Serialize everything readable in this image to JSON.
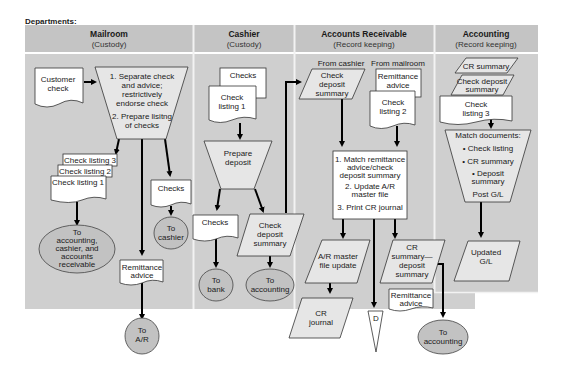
{
  "title": "Departments:",
  "lanes": [
    {
      "name": "Mailroom",
      "role": "(Custody)"
    },
    {
      "name": "Cashier",
      "role": "(Custody)"
    },
    {
      "name": "Accounts Receivable",
      "role": "(Record keeping)"
    },
    {
      "name": "Accounting",
      "role": "(Record keeping)"
    }
  ],
  "mailroom": {
    "customer_check": [
      "Customer",
      "check"
    ],
    "process": [
      "1. Separate check",
      "and advice;",
      "restrictively",
      "endorse check",
      "",
      "2. Prepare lisitng",
      "of checks"
    ],
    "check_listing_3": "Check listing 3",
    "check_listing_2": "Check listing 2",
    "check_listing_1": "Check listing 1",
    "to_all": [
      "To",
      "accounting,",
      "cashier, and",
      "accounts",
      "receivable"
    ],
    "checks": "Checks",
    "to_cashier": [
      "To",
      "cashier"
    ],
    "remittance_advice": [
      "Remittance",
      "advice"
    ],
    "to_ar": [
      "To",
      "A/R"
    ]
  },
  "cashier": {
    "checks_top": "Checks",
    "check_listing_1": [
      "Check",
      "listing 1"
    ],
    "prepare_deposit": [
      "Prepare",
      "deposit"
    ],
    "checks": "Checks",
    "to_bank": [
      "To",
      "bank"
    ],
    "check_deposit_summary": [
      "Check",
      "deposit",
      "summary"
    ],
    "to_accounting": [
      "To",
      "accounting"
    ]
  },
  "accounts_receivable": {
    "from_cashier": "From cashier",
    "from_mailroom": "From mailroom",
    "check_deposit_summary": [
      "Check",
      "deposit",
      "summary"
    ],
    "remittance_advice": [
      "Remittance",
      "advice"
    ],
    "check_listing_2": [
      "Check",
      "listing 2"
    ],
    "process": [
      "1. Match remittance",
      "advice/check",
      "deposit summary",
      "2. Update A/R",
      "master file",
      "3. Print CR journal"
    ],
    "ar_master_update": [
      "A/R master",
      "file update"
    ],
    "cr_journal": [
      "CR",
      "journal"
    ],
    "file_d": "D",
    "cr_summary": [
      "CR",
      "summary—",
      "deposit",
      "summary"
    ],
    "remittance_advice_2": [
      "Remittance",
      "advice"
    ],
    "to_accounting": [
      "To",
      "accounting"
    ]
  },
  "accounting": {
    "cr_summary": "CR summary",
    "check_deposit_summary": [
      "Check deposit",
      "summary"
    ],
    "check_listing_3": [
      "Check",
      "listing 3"
    ],
    "process": [
      "Match documents:",
      "• Check listing",
      "• CR summary",
      "• Deposit",
      "summary",
      "Post G/L"
    ],
    "updated_gl": [
      "Updated",
      "G/L"
    ]
  }
}
